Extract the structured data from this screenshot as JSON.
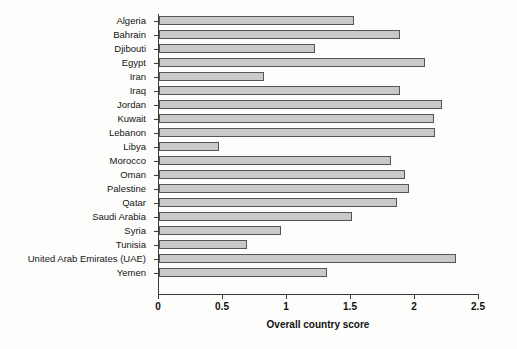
{
  "chart_data": {
    "type": "bar",
    "orientation": "horizontal",
    "title": "",
    "xlabel": "Overall country score",
    "ylabel": "",
    "xlim": [
      0,
      2.5
    ],
    "xticks": [
      "0",
      "0.5",
      "1",
      "1.5",
      "2",
      "2.5"
    ],
    "xtick_values": [
      0,
      0.5,
      1,
      1.5,
      2,
      2.5
    ],
    "grid": false,
    "legend": null,
    "bar_fill_color": "#c9c9c9",
    "bar_edge_color": "#555555",
    "categories": [
      "Algeria",
      "Bahrain",
      "Djibouti",
      "Egypt",
      "Iran",
      "Iraq",
      "Jordan",
      "Kuwait",
      "Lebanon",
      "Libya",
      "Morocco",
      "Oman",
      "Palestine",
      "Qatar",
      "Saudi Arabia",
      "Syria",
      "Tunisia",
      "United Arab Emirates (UAE)",
      "Yemen"
    ],
    "values": [
      1.52,
      1.88,
      1.22,
      2.08,
      0.82,
      1.88,
      2.21,
      2.15,
      2.16,
      0.47,
      1.81,
      1.92,
      1.95,
      1.86,
      1.51,
      0.95,
      0.69,
      2.32,
      1.31
    ]
  }
}
